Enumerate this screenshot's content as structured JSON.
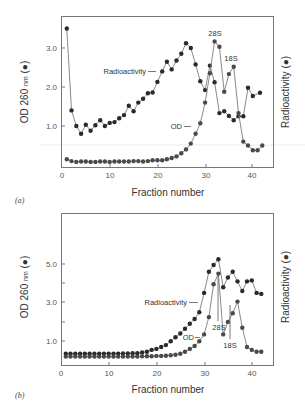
{
  "chart_data": [
    {
      "panel": "(a)",
      "type": "line",
      "xlabel": "Fraction number",
      "ylabel_left": "OD 260 nm (●)",
      "ylabel_right": "Radioactivity (●)",
      "x_ticks": [
        0,
        10,
        20,
        30,
        40
      ],
      "y_ticks": [
        1.0,
        2.0,
        3.0
      ],
      "y_tick_labels": [
        "1.0",
        "2.0",
        "3.0"
      ],
      "xlim": [
        0,
        45
      ],
      "ylim": [
        0,
        3.9
      ],
      "grid": false,
      "annotations": [
        "Radioactivity",
        "OD",
        "28S",
        "18S"
      ],
      "series": [
        {
          "name": "Radioactivity",
          "x": [
            1,
            2,
            3,
            4,
            5,
            6,
            7,
            8,
            9,
            10,
            11,
            12,
            13,
            14,
            15,
            16,
            17,
            18,
            19,
            20,
            21,
            22,
            23,
            24,
            25,
            26,
            27,
            28,
            29,
            30,
            31,
            32,
            33,
            34,
            35,
            36,
            37,
            38,
            39,
            40,
            41.5
          ],
          "values": [
            3.5,
            1.4,
            1.0,
            0.8,
            1.03,
            0.88,
            1.02,
            1.15,
            1.0,
            1.08,
            1.1,
            1.2,
            1.28,
            1.52,
            1.38,
            1.6,
            1.7,
            1.84,
            1.86,
            2.13,
            2.4,
            2.65,
            2.45,
            2.68,
            2.85,
            3.12,
            3.0,
            2.58,
            2.15,
            1.92,
            2.55,
            2.12,
            1.33,
            1.38,
            1.26,
            1.15,
            1.25,
            1.25,
            1.98,
            1.77,
            1.85
          ]
        },
        {
          "name": "OD",
          "x": [
            1,
            2,
            3,
            4,
            5,
            6,
            7,
            8,
            9,
            10,
            11,
            12,
            13,
            14,
            15,
            16,
            17,
            18,
            19,
            20,
            21,
            22,
            23,
            24,
            25,
            26,
            27,
            28,
            29,
            30,
            31,
            32,
            33,
            34,
            35,
            36,
            37,
            38,
            39,
            40,
            41,
            42
          ],
          "values": [
            0.15,
            0.1,
            0.08,
            0.09,
            0.09,
            0.08,
            0.08,
            0.09,
            0.09,
            0.08,
            0.09,
            0.09,
            0.09,
            0.09,
            0.1,
            0.1,
            0.09,
            0.1,
            0.12,
            0.12,
            0.12,
            0.15,
            0.18,
            0.22,
            0.3,
            0.4,
            0.55,
            0.8,
            1.07,
            1.6,
            2.35,
            3.17,
            3.03,
            1.88,
            2.33,
            2.52,
            1.33,
            0.6,
            0.5,
            0.38,
            0.38,
            0.5
          ]
        }
      ]
    },
    {
      "panel": "(b)",
      "type": "line",
      "xlabel": "Fraction number",
      "ylabel_left": "OD 260 nm (●)",
      "ylabel_right": "Radioactivity (●)",
      "x_ticks": [
        0,
        10,
        20,
        30,
        40
      ],
      "y_ticks": [
        1.0,
        2.0,
        3.0,
        4.0,
        5.0
      ],
      "y_tick_labels": [
        "1.0",
        "",
        "3.0",
        "",
        "5.0"
      ],
      "xlim": [
        0,
        45
      ],
      "ylim": [
        0,
        7.6
      ],
      "grid": false,
      "annotations": [
        "Radioactivity",
        "OD",
        "28S",
        "18S"
      ],
      "series": [
        {
          "name": "Radioactivity",
          "x": [
            1,
            2,
            3,
            4,
            5,
            6,
            7,
            8,
            9,
            10,
            11,
            12,
            13,
            14,
            15,
            16,
            17,
            18,
            19,
            20,
            21,
            22,
            23,
            24,
            25,
            26,
            27,
            28,
            29,
            30,
            31,
            32,
            33,
            34,
            35,
            36,
            37,
            38,
            39,
            40,
            41,
            42
          ],
          "values": [
            0.35,
            0.35,
            0.35,
            0.35,
            0.35,
            0.35,
            0.35,
            0.35,
            0.36,
            0.36,
            0.36,
            0.36,
            0.37,
            0.37,
            0.38,
            0.38,
            0.42,
            0.45,
            0.55,
            0.6,
            0.7,
            0.8,
            1.0,
            1.2,
            1.4,
            1.65,
            1.9,
            2.15,
            2.5,
            3.5,
            4.6,
            4.95,
            5.25,
            3.8,
            4.3,
            4.6,
            4.1,
            3.6,
            4.1,
            4.15,
            3.5,
            3.45
          ]
        },
        {
          "name": "OD",
          "x": [
            1,
            2,
            3,
            4,
            5,
            6,
            7,
            8,
            9,
            10,
            11,
            12,
            13,
            14,
            15,
            16,
            17,
            18,
            19,
            20,
            21,
            22,
            23,
            24,
            25,
            26,
            27,
            28,
            29,
            30,
            31,
            32,
            33,
            34,
            35,
            36,
            37,
            38,
            39,
            40,
            41,
            42
          ],
          "values": [
            0.2,
            0.2,
            0.2,
            0.2,
            0.2,
            0.2,
            0.2,
            0.2,
            0.2,
            0.2,
            0.2,
            0.2,
            0.2,
            0.2,
            0.2,
            0.2,
            0.22,
            0.22,
            0.22,
            0.24,
            0.24,
            0.25,
            0.27,
            0.3,
            0.35,
            0.45,
            0.6,
            0.75,
            1.0,
            1.35,
            2.25,
            3.95,
            4.5,
            1.35,
            2.0,
            2.45,
            3.05,
            1.7,
            0.7,
            0.55,
            0.45,
            0.45,
            0.6
          ]
        }
      ]
    }
  ],
  "panels": {
    "a": {
      "label": "(a)",
      "xlabel": "Fraction number",
      "ylabel_left": "OD 260 nm (●)",
      "ylabel_left_main": "OD 260",
      "ylabel_left_unit": "nm",
      "ylabel_left_sym": "(●)",
      "ylabel_right": "Radioactivity (●)",
      "y_tick_labels": [
        "3.0",
        "2.0",
        "1.0"
      ],
      "x_tick_labels": [
        "0",
        "10",
        "20",
        "30",
        "40"
      ],
      "ann_radio": "Radioactivity",
      "ann_od": "OD",
      "ann_28s": "28S",
      "ann_18s": "18S"
    },
    "b": {
      "label": "(b)",
      "xlabel": "Fraction number",
      "ylabel_left": "OD 260 nm (●)",
      "ylabel_left_main": "OD 260",
      "ylabel_left_unit": "nm",
      "ylabel_left_sym": "(●)",
      "ylabel_right": "Radioactivity (●)",
      "y_tick_labels": [
        "5.0",
        "3.0",
        "1.0"
      ],
      "x_tick_labels": [
        "0",
        "10",
        "20",
        "30",
        "40"
      ],
      "ann_radio": "Radioactivity",
      "ann_od": "OD",
      "ann_28s": "28S",
      "ann_18s": "18S"
    }
  },
  "colors": {
    "radioactivity_marker": "#2a2a2a",
    "od_marker": "#4a4a4a",
    "line": "#8a8a8a",
    "frame": "#777777"
  }
}
